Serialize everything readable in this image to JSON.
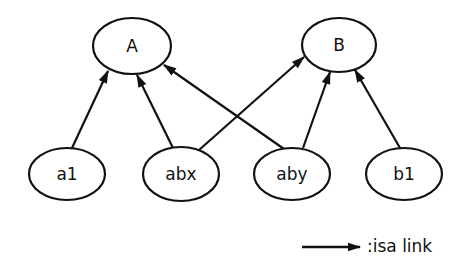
{
  "colors": {
    "stroke": "#111111",
    "background": "#ffffff"
  },
  "nodes": [
    {
      "id": "A",
      "label": "A",
      "cx": 132,
      "cy": 46,
      "rx": 39,
      "ry": 28
    },
    {
      "id": "B",
      "label": "B",
      "cx": 339,
      "cy": 45,
      "rx": 37,
      "ry": 27
    },
    {
      "id": "a1",
      "label": "a1",
      "cx": 67,
      "cy": 174,
      "rx": 38,
      "ry": 26
    },
    {
      "id": "abx",
      "label": "abx",
      "cx": 181,
      "cy": 174,
      "rx": 38,
      "ry": 27
    },
    {
      "id": "aby",
      "label": "aby",
      "cx": 292,
      "cy": 174,
      "rx": 38,
      "ry": 26
    },
    {
      "id": "b1",
      "label": "b1",
      "cx": 404,
      "cy": 174,
      "rx": 38,
      "ry": 26
    }
  ],
  "edges": [
    {
      "from": "a1",
      "to": "A",
      "x1": 72,
      "y1": 148,
      "x2": 108,
      "y2": 71
    },
    {
      "from": "abx",
      "to": "A",
      "x1": 173,
      "y1": 148,
      "x2": 137,
      "y2": 75
    },
    {
      "from": "aby",
      "to": "A",
      "x1": 284,
      "y1": 149,
      "x2": 164,
      "y2": 65
    },
    {
      "from": "abx",
      "to": "B",
      "x1": 199,
      "y1": 150,
      "x2": 304,
      "y2": 57
    },
    {
      "from": "aby",
      "to": "B",
      "x1": 303,
      "y1": 148,
      "x2": 330,
      "y2": 72
    },
    {
      "from": "b1",
      "to": "B",
      "x1": 400,
      "y1": 148,
      "x2": 355,
      "y2": 70
    }
  ],
  "legend": {
    "label": ":isa link",
    "arrow": {
      "x1": 302,
      "y1": 247,
      "x2": 360,
      "y2": 247
    },
    "label_x": 367,
    "label_y": 246
  }
}
